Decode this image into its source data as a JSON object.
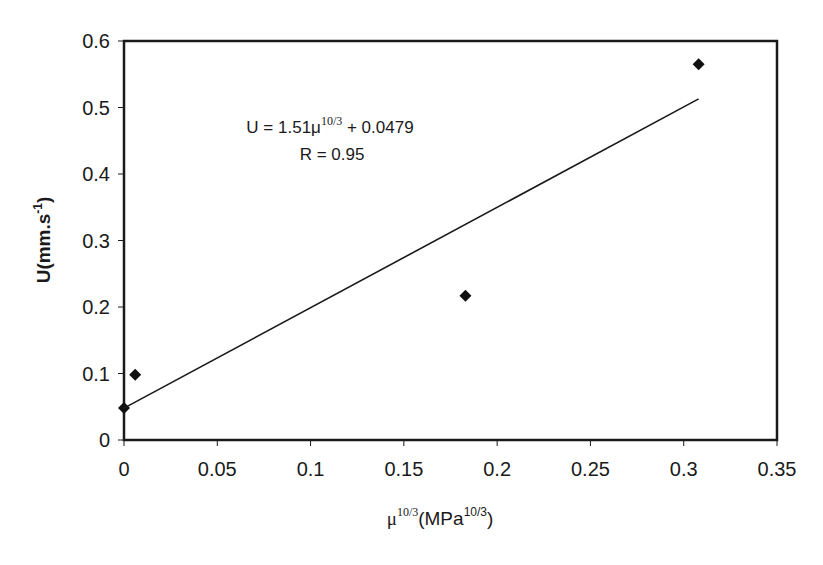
{
  "chart_data": {
    "type": "scatter",
    "title": "",
    "xlabel": "μ^10/3(MPa^10/3)",
    "ylabel": "U(mm.s^-1)",
    "xlim": [
      0,
      0.35
    ],
    "ylim": [
      0,
      0.6
    ],
    "x_ticks": [
      "0",
      "0.05",
      "0.1",
      "0.15",
      "0.2",
      "0.25",
      "0.3",
      "0.35"
    ],
    "y_ticks": [
      "0",
      "0.1",
      "0.2",
      "0.3",
      "0.4",
      "0.5",
      "0.6"
    ],
    "grid": false,
    "legend": null,
    "series": [
      {
        "name": "data",
        "marker": "diamond",
        "points": [
          {
            "x": 0.0,
            "y": 0.048
          },
          {
            "x": 0.006,
            "y": 0.098
          },
          {
            "x": 0.183,
            "y": 0.217
          },
          {
            "x": 0.308,
            "y": 0.565
          }
        ]
      },
      {
        "name": "linear fit",
        "type": "line",
        "slope": 1.51,
        "intercept": 0.0479,
        "x_range": [
          0,
          0.308
        ]
      }
    ],
    "annotations": {
      "equation_prefix": "U = 1.51μ",
      "equation_sup": "10/3",
      "equation_suffix": " + 0.0479",
      "r_value": "R = 0.95"
    },
    "axis_labels": {
      "y_main": "U(mm.s",
      "y_sup": "-1",
      "y_close": ")",
      "x_mu": "μ",
      "x_mu_sup": "10/3",
      "x_unit": "(MPa",
      "x_unit_sup": "10/3",
      "x_close": ")"
    }
  }
}
